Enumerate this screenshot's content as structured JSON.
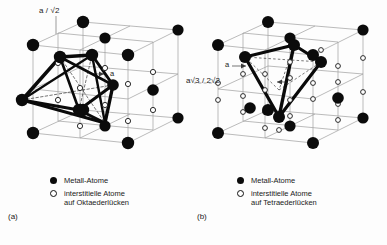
{
  "figure": {
    "type": "crystal-structure-diagram",
    "background_color": "#fdfdfd",
    "atom_color": "#0b0b0b",
    "interstitial_color": "#ffffff",
    "lattice_line_color": "#9a9a9a",
    "highlight_color": "#000000"
  },
  "panels": [
    {
      "tag": "(a)",
      "name": "octahedral",
      "polyhedron": "octahedron",
      "dimension_labels": [
        {
          "id": "edge-label",
          "text": "a / √2"
        },
        {
          "id": "cell-edge-label",
          "text": "a"
        }
      ],
      "legend": [
        {
          "marker": "filled-circle",
          "label": "Metall-Atome"
        },
        {
          "marker": "open-circle",
          "label": "interstitielle Atome\nauf Oktaederlücken"
        }
      ],
      "legend_lines": [
        "Metall-Atome",
        "interstitielle Atome",
        "auf Oktaederlücken"
      ]
    },
    {
      "tag": "(b)",
      "name": "tetrahedral",
      "polyhedron": "tetrahedron",
      "dimension_labels": [
        {
          "id": "edge-label",
          "text": "a√3 / 2√2"
        },
        {
          "id": "cell-edge-label",
          "text": "a"
        }
      ],
      "legend": [
        {
          "marker": "filled-circle",
          "label": "Metall-Atome"
        },
        {
          "marker": "open-circle",
          "label": "interstitielle Atome\nauf Tetraederlücken"
        }
      ],
      "legend_lines": [
        "Metall-Atome",
        "interstitielle Atome",
        "auf Tetraederlücken"
      ]
    }
  ],
  "labels": {
    "a_edge_sqrt2": "a / √2",
    "a_sqrt3_2sqrt2": "a√3 / 2√2",
    "a_short": "a",
    "metal_atoms": "Metall-Atome",
    "interstitial_line1": "interstitielle Atome",
    "interstitial_octa_line2": "auf Oktaederlücken",
    "interstitial_tetra_line2": "auf Tetraederlücken",
    "tag_a": "(a)",
    "tag_b": "(b)"
  }
}
